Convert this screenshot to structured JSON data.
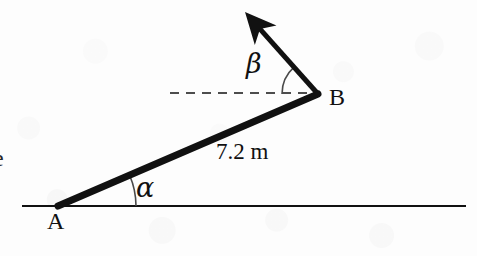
{
  "figure": {
    "kind": "geometry-diagram",
    "background_color": "#fdfdfd",
    "ink_color": "#111111",
    "canvas": {
      "width": 477,
      "height": 256
    }
  },
  "labels": {
    "point_a": "A",
    "point_b": "B",
    "angle_alpha": "α",
    "angle_beta": "β",
    "length_ab": "7.2 m",
    "clipped_text_left": "e"
  },
  "geometry": {
    "ground_line": {
      "x1": 22,
      "y1": 206,
      "x2": 466,
      "y2": 206,
      "stroke_width": 2
    },
    "rod_ab": {
      "x1": 58,
      "y1": 206,
      "x2": 318,
      "y2": 94,
      "stroke_width": 7
    },
    "velocity_arrow": {
      "x1": 318,
      "y1": 94,
      "x2": 252,
      "y2": 20,
      "stroke_width": 5
    },
    "dashed_horizontal": {
      "x1": 170,
      "y1": 93,
      "x2": 312,
      "y2": 93,
      "stroke_width": 2,
      "dash": "9 7"
    },
    "alpha_arc": {
      "center_x": 58,
      "center_y": 206,
      "radius": 78,
      "start_deg": 0,
      "end_deg": 23.3
    },
    "beta_arc": {
      "center_x": 318,
      "center_y": 94,
      "radius": 36,
      "start_deg": 180,
      "end_deg": 131.7
    },
    "label_positions": {
      "point_a": {
        "x": 47,
        "y": 209
      },
      "point_b": {
        "x": 329,
        "y": 85
      },
      "angle_alpha": {
        "x": 136,
        "y": 174
      },
      "angle_beta": {
        "x": 246,
        "y": 50
      },
      "length_ab": {
        "x": 216,
        "y": 140
      },
      "clipped_text_left": {
        "x": -7,
        "y": 146
      }
    }
  },
  "measurements": {
    "rod_length_label": "7.2 m",
    "rod_length_value": 7.2,
    "rod_length_unit": "m",
    "alpha_angle_deg_estimate": 23,
    "beta_angle_deg_estimate": 48
  }
}
